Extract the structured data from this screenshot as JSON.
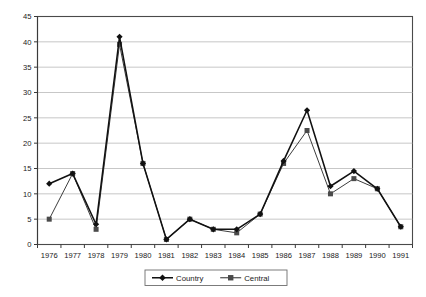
{
  "chart_data": {
    "type": "line",
    "title": "",
    "xlabel": "",
    "ylabel": "",
    "categories": [
      "1976",
      "1977",
      "1978",
      "1979",
      "1980",
      "1981",
      "1982",
      "1983",
      "1984",
      "1985",
      "1986",
      "1987",
      "1988",
      "1989",
      "1990",
      "1991"
    ],
    "ylim": [
      0,
      45
    ],
    "yticks": [
      0,
      5,
      10,
      15,
      20,
      25,
      30,
      35,
      40,
      45
    ],
    "ytick_labels": [
      "0",
      "5",
      "10",
      "15",
      "20",
      "25",
      "30",
      "35",
      "40",
      "45"
    ],
    "grid": true,
    "legend_position": "bottom-center",
    "series": [
      {
        "name": "Country",
        "marker": "diamond",
        "color": "#111111",
        "values": [
          12,
          14,
          4,
          41,
          16,
          1,
          5,
          3,
          3,
          6,
          16.5,
          26.5,
          11.5,
          14.5,
          11,
          3.5
        ]
      },
      {
        "name": "Central",
        "marker": "square",
        "color": "#4a4a4a",
        "values": [
          5,
          14,
          3,
          39.5,
          16,
          1,
          5,
          3,
          2.3,
          6,
          16,
          22.5,
          10,
          13,
          11,
          3.5
        ]
      }
    ]
  },
  "legend": {
    "entries": [
      "Country",
      "Central"
    ]
  }
}
